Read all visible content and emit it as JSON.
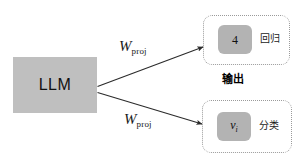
{
  "diagram": {
    "model_block": {
      "label": "LLM",
      "fill_color": "#bfbfbf"
    },
    "edges": [
      {
        "name": "regression-projection",
        "label_symbol": "W",
        "label_subscript": "proj",
        "from": "LLM",
        "to": "regression-output"
      },
      {
        "name": "classification-projection",
        "label_symbol": "W",
        "label_subscript": "proj",
        "from": "LLM",
        "to": "classification-output"
      }
    ],
    "output_caption": "输出",
    "groups": [
      {
        "name": "regression",
        "chip_value": "4",
        "chip_is_math": false,
        "task_label": "回归",
        "chip_color": "#b3b3b3",
        "border_color": "#9a9a9a"
      },
      {
        "name": "classification",
        "chip_value": "v",
        "chip_subscript": "i",
        "chip_is_math": true,
        "task_label": "分类",
        "chip_color": "#b3b3b3",
        "border_color": "#9a9a9a"
      }
    ]
  }
}
